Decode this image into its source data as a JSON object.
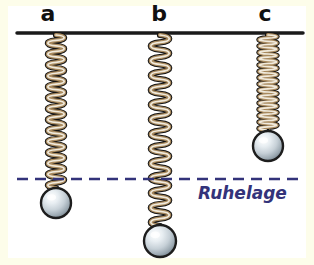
{
  "figure": {
    "canvas": {
      "width": 314,
      "height": 265
    },
    "background_color": "#ffffff",
    "border_color": "#fdfdea",
    "ceiling": {
      "label": "",
      "color": "#1a1a1a",
      "y": 33,
      "x_start": 17,
      "x_end": 303,
      "thickness": 3.5
    },
    "equilibrium_line": {
      "label": "Ruhelage",
      "label_color": "#33337a",
      "line_color": "#33337a",
      "y": 179,
      "x_start": 17,
      "x_end": 303,
      "thickness": 2.5,
      "dash": "11 7",
      "label_x": 198,
      "label_y": 199
    },
    "spring_colors": {
      "wire_dark": "#141414",
      "wire_tan": "#a98a5e",
      "wire_light": "#f3efe4",
      "wire_shadow": "#6f5937"
    },
    "ball_colors": {
      "outline": "#1d1d1d",
      "fill_light": "#f2f6f8",
      "fill_mid": "#c3cdd4",
      "fill_dark": "#8b98a2",
      "highlight": "#ffffff"
    },
    "pendulums": [
      {
        "id": "a",
        "label": "a",
        "label_x": 48,
        "label_y": 21,
        "spring_x": 56,
        "spring_top": 33,
        "spring_bottom": 188,
        "coil_count": 14,
        "coil_width": 15,
        "ball_cx": 56,
        "ball_cy": 203,
        "ball_r": 15,
        "state": "ausgelenkt nach unten bis Ruhelage"
      },
      {
        "id": "b",
        "label": "b",
        "label_x": 159,
        "label_y": 21,
        "spring_x": 160,
        "spring_top": 33,
        "spring_bottom": 226,
        "coil_count": 13,
        "coil_width": 17,
        "ball_cx": 160,
        "ball_cy": 241,
        "ball_r": 16,
        "state": "maximal nach unten ausgelenkt"
      },
      {
        "id": "c",
        "label": "c",
        "label_x": 265,
        "label_y": 21,
        "spring_x": 268,
        "spring_top": 33,
        "spring_bottom": 130,
        "coil_count": 15,
        "coil_width": 16,
        "ball_cx": 268,
        "ball_cy": 146,
        "ball_r": 15,
        "state": "nach oben ausgelenkt / zusammengedrueckt"
      }
    ],
    "label_color": "#111111",
    "label_font_size": 22
  }
}
